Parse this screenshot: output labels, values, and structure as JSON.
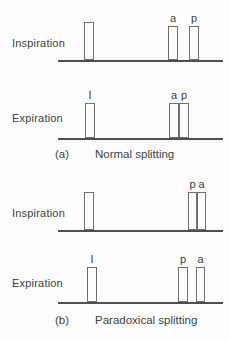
{
  "figure": {
    "panels": [
      {
        "caption_label": "(a)",
        "caption_text": "Normal splitting",
        "rows": [
          {
            "label": "Inspiration",
            "baseline_y": 60,
            "line_x1": 58,
            "line_x2": 223,
            "bars": [
              {
                "label": "",
                "x": 84,
                "w": 10,
                "h": 38
              },
              {
                "label": "a",
                "x": 168,
                "w": 10,
                "h": 34
              },
              {
                "label": "p",
                "x": 189,
                "w": 10,
                "h": 34
              }
            ]
          },
          {
            "label": "Expiration",
            "baseline_y": 138,
            "line_x1": 58,
            "line_x2": 223,
            "bars": [
              {
                "label": "I",
                "x": 85,
                "w": 10,
                "h": 35
              },
              {
                "label": "a",
                "x": 169,
                "w": 10,
                "h": 35
              },
              {
                "label": "p",
                "x": 179,
                "w": 10,
                "h": 35
              }
            ]
          }
        ]
      },
      {
        "caption_label": "(b)",
        "caption_text": "Paradoxical splitting",
        "rows": [
          {
            "label": "Inspiration",
            "baseline_y": 230,
            "line_x1": 58,
            "line_x2": 223,
            "bars": [
              {
                "label": "",
                "x": 84,
                "w": 10,
                "h": 38
              },
              {
                "label": "p",
                "x": 188,
                "w": 9,
                "h": 38
              },
              {
                "label": "a",
                "x": 197,
                "w": 9,
                "h": 38
              }
            ]
          },
          {
            "label": "Expiration",
            "baseline_y": 302,
            "line_x1": 58,
            "line_x2": 223,
            "bars": [
              {
                "label": "I",
                "x": 87,
                "w": 10,
                "h": 35
              },
              {
                "label": "p",
                "x": 178,
                "w": 10,
                "h": 35
              },
              {
                "label": "a",
                "x": 196,
                "w": 9,
                "h": 35
              }
            ]
          }
        ]
      }
    ]
  },
  "colors": {
    "background": "#fdfdfd",
    "line": "#4f4f4f",
    "bar_border": "#707070",
    "text": "#3e3e3e"
  }
}
